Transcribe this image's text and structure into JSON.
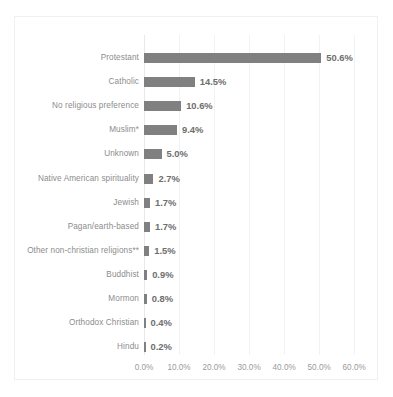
{
  "chart_data": {
    "type": "bar",
    "orientation": "horizontal",
    "title": "",
    "xlabel": "",
    "ylabel": "",
    "xlim": [
      0,
      64.8
    ],
    "grid": true,
    "legend": null,
    "tick_labels": [
      "0.0%",
      "10.0%",
      "20.0%",
      "30.0%",
      "40.0%",
      "50.0%",
      "60.0%"
    ],
    "tick_values": [
      0,
      10,
      20,
      30,
      40,
      50,
      60
    ],
    "bar_color": "#808080",
    "gridline_color": "#f2f2f2",
    "categories": [
      "Protestant",
      "Catholic",
      "No religious preference",
      "Muslim*",
      "Unknown",
      "Native American spirituality",
      "Jewish",
      "Pagan/earth-based",
      "Other non-christian religions**",
      "Buddhist",
      "Mormon",
      "Orthodox Christian",
      "Hindu"
    ],
    "values": [
      50.6,
      14.5,
      10.6,
      9.4,
      5.0,
      2.7,
      1.7,
      1.7,
      1.5,
      0.9,
      0.8,
      0.4,
      0.2
    ],
    "data_labels": [
      "50.6%",
      "14.5%",
      "10.6%",
      "9.4%",
      "5.0%",
      "2.7%",
      "1.7%",
      "1.7%",
      "1.5%",
      "0.9%",
      "0.8%",
      "0.4%",
      "0.2%"
    ]
  }
}
